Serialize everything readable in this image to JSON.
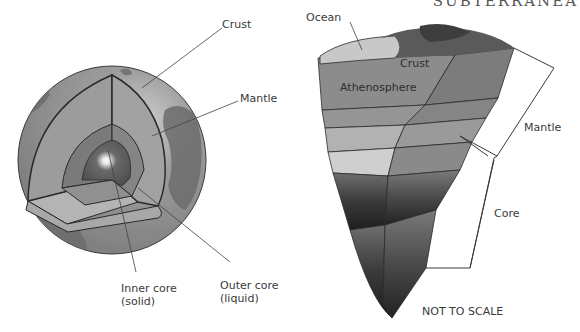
{
  "header": {
    "title": "SUBTERRANEA"
  },
  "globe": {
    "labels": {
      "crust": "Crust",
      "mantle": "Mantle",
      "inner_core_line1": "Inner core",
      "inner_core_line2": "(solid)",
      "outer_core_line1": "Outer core",
      "outer_core_line2": "(liquid)"
    }
  },
  "wedge": {
    "labels": {
      "ocean": "Ocean",
      "crust": "Crust",
      "athenosphere": "Athenosphere",
      "mantle": "Mantle",
      "core": "Core",
      "scale_note": "NOT TO SCALE"
    }
  },
  "colors": {
    "globe_surface": "#8e8e8e",
    "globe_land": "#6d6d6d",
    "mantle": "#9a9a9a",
    "outer_core": "#7a7a7a",
    "inner_core": "#5c5c5c",
    "line": "#2a2a2a",
    "label_text": "#3a3a3a"
  }
}
